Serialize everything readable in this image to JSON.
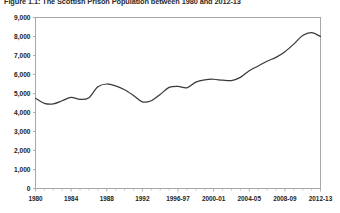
{
  "figure": {
    "title": "Figure 1.1: The Scottish Prison Population between 1980 and 2012-13",
    "title_truncated": true
  },
  "chart_data": {
    "type": "line",
    "title": "Figure 1.1: The Scottish Prison Population between 1980 and 2012-13",
    "xlabel": "",
    "ylabel": "",
    "ylim": [
      0,
      9000
    ],
    "ytick_values": [
      0,
      1000,
      2000,
      3000,
      4000,
      5000,
      6000,
      7000,
      8000,
      9000
    ],
    "ytick_labels": [
      "0",
      "1,000",
      "2,000",
      "3,000",
      "4,000",
      "5,000",
      "6,000",
      "7,000",
      "8,000",
      "9,000"
    ],
    "xtick_labels": [
      "1980",
      "1984",
      "1988",
      "1992",
      "1996-97",
      "2000-01",
      "2004-05",
      "2008-09",
      "2012-13"
    ],
    "xtick_positions": [
      0,
      4,
      8,
      12,
      16,
      20,
      24,
      28,
      32
    ],
    "grid": false,
    "legend": null,
    "legend_position": "none",
    "line_color": "#3a3a3a",
    "categories": [
      "1980",
      "1981",
      "1982",
      "1983",
      "1984",
      "1985",
      "1986",
      "1987",
      "1988",
      "1989",
      "1990",
      "1991",
      "1992",
      "1993",
      "1994",
      "1995",
      "1996-97",
      "1997-98",
      "1998-99",
      "1999-00",
      "2000-01",
      "2001-02",
      "2002-03",
      "2003-04",
      "2004-05",
      "2005-06",
      "2006-07",
      "2007-08",
      "2008-09",
      "2009-10",
      "2010-11",
      "2011-12",
      "2012-13"
    ],
    "values": [
      4750,
      4480,
      4450,
      4620,
      4800,
      4690,
      4780,
      5350,
      5500,
      5400,
      5200,
      4900,
      4560,
      4620,
      4950,
      5320,
      5380,
      5300,
      5600,
      5720,
      5750,
      5700,
      5680,
      5850,
      6200,
      6450,
      6700,
      6900,
      7200,
      7600,
      8050,
      8200,
      8000
    ],
    "series": [
      {
        "name": "Scottish prison population",
        "values": [
          4750,
          4480,
          4450,
          4620,
          4800,
          4690,
          4780,
          5350,
          5500,
          5400,
          5200,
          4900,
          4560,
          4620,
          4950,
          5320,
          5380,
          5300,
          5600,
          5720,
          5750,
          5700,
          5680,
          5850,
          6200,
          6450,
          6700,
          6900,
          7200,
          7600,
          8050,
          8200,
          8000
        ]
      }
    ],
    "annotations": []
  }
}
